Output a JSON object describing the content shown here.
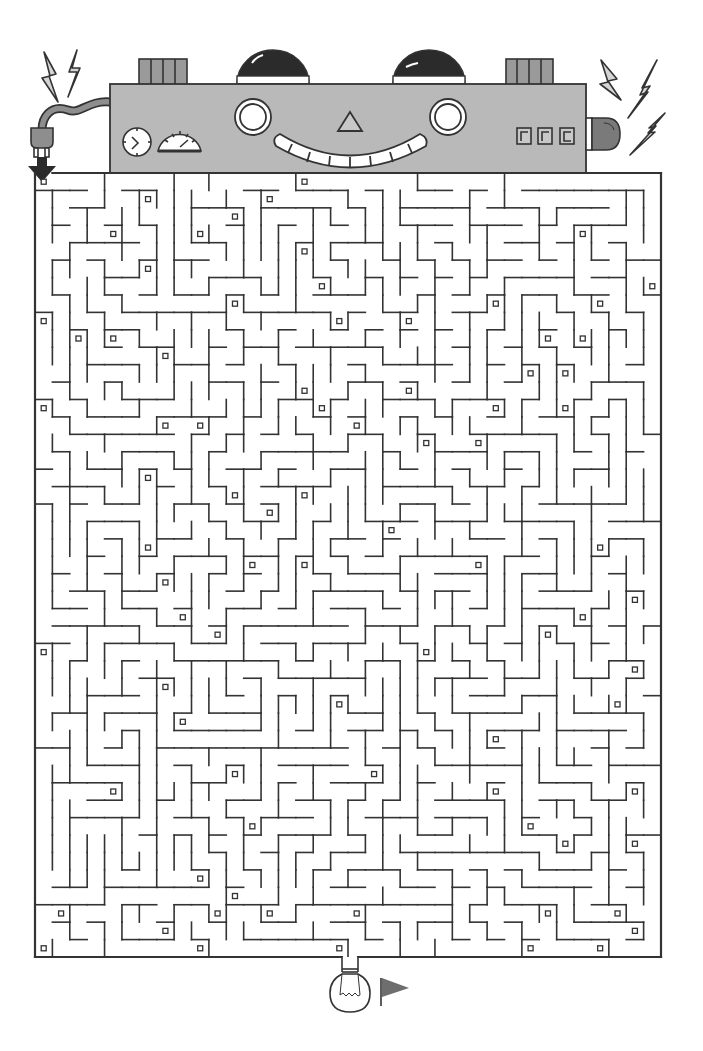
{
  "puzzle": {
    "type": "maze",
    "title": "Robot circuit maze",
    "start_label": "start-arrow",
    "end_label": "light-bulb-goal"
  },
  "colors": {
    "line": "#333333",
    "robot_body": "#b9b9b9",
    "robot_dark": "#8e8e8e",
    "dome": "#2b2b2b",
    "bolt_fill": "#d4d4d4",
    "light_fill": "#7a7a7a",
    "flag": "#6e6e6e",
    "paper": "#ffffff"
  },
  "robot": {
    "display_digits": [
      "r",
      "r",
      "c"
    ],
    "gauges": [
      "clock",
      "speedometer"
    ]
  },
  "maze": {
    "left": 35,
    "top": 173,
    "right": 661,
    "bottom": 957,
    "cols": 36,
    "rows": 45,
    "entrance": "top-left",
    "exit": "bottom-center"
  }
}
